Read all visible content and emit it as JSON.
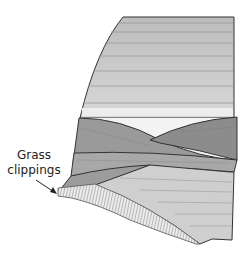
{
  "diagram": {
    "annotation": {
      "line1": "Grass",
      "line2": "clippings"
    },
    "colors": {
      "background": "#ffffff",
      "upper_layers": "#c8c8c8",
      "upper_layers_light": "#d6d6d6",
      "crossing_band_dark": "#8f8f8f",
      "crossing_band_mid": "#a0a0a0",
      "lower_layers": "#cfcfcf",
      "white_gap": "#f2f2f2",
      "hatch": "#888888",
      "outline": "#333333"
    }
  }
}
